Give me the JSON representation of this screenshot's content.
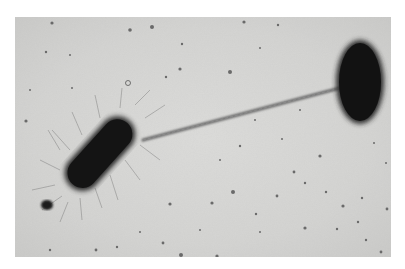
{
  "image": {
    "kind": "transmission electron micrograph",
    "subject": "two rod-shaped bacteria connected by a sex pilus (conjugation)",
    "background_color": "#d6d6d4",
    "cell_color": "#141414",
    "border_color": "#ffffff"
  },
  "objects": [
    {
      "name": "donor-bacterium",
      "description": "elongated rod-shaped cell covered in fine pili/fimbriae, lower left"
    },
    {
      "name": "recipient-bacterium",
      "description": "smooth oval rod-shaped cell, upper right"
    },
    {
      "name": "sex-pilus",
      "description": "long thin filament connecting the two cells"
    },
    {
      "name": "small-particle",
      "description": "small dark round particle near tail of left cell"
    },
    {
      "name": "debris-particles",
      "description": "scattered dark dots across background"
    }
  ]
}
